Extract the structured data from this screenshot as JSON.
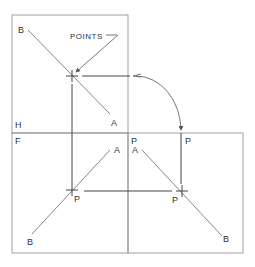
{
  "diagram": {
    "title_callout": "POINTS",
    "views": {
      "top": {
        "label": "H"
      },
      "front": {
        "label": "F"
      },
      "side": {
        "label": "P"
      }
    },
    "labels": {
      "top_B": "B",
      "top_A": "A",
      "front_A": "A",
      "front_P": "P",
      "front_B": "B",
      "side_A": "A",
      "side_P_top": "P",
      "side_P": "P",
      "side_B": "B"
    },
    "colors": {
      "line": "#555555",
      "box": "#777777",
      "text": "#333333"
    }
  }
}
